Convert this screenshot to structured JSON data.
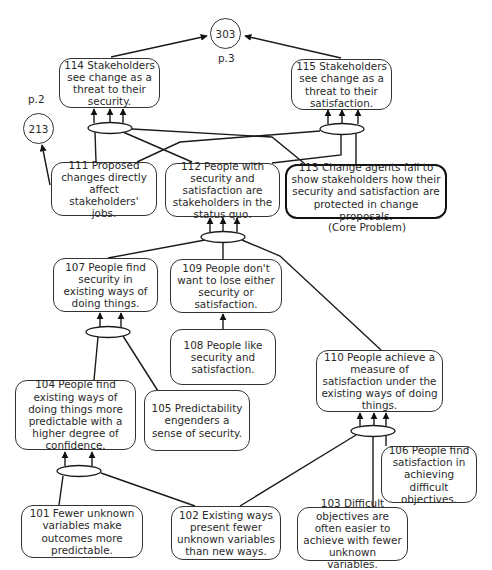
{
  "diagram": {
    "type": "current reality tree",
    "connectors": {
      "303": {
        "label": "303",
        "page": "p.3"
      },
      "213": {
        "label": "213",
        "page": "p.2"
      }
    },
    "nodes": [
      {
        "id": "114",
        "text": "114  Stakeholders see change as a threat to their security."
      },
      {
        "id": "115",
        "text": "115  Stakeholders see change as a threat to their satisfaction."
      },
      {
        "id": "111",
        "text": "111  Proposed changes directly affect stakeholders' jobs."
      },
      {
        "id": "112",
        "text": "112 People with security and satisfaction are stakeholders in the status quo."
      },
      {
        "id": "113",
        "text": "113  Change agents fail to show stakeholders how their security and satisfaction are protected in change proposals.",
        "note": "(Core Problem)"
      },
      {
        "id": "107",
        "text": "107  People find security in existing ways of doing things."
      },
      {
        "id": "109",
        "text": "109  People don't want to lose either security or satisfaction."
      },
      {
        "id": "108",
        "text": "108  People like security and satisfaction."
      },
      {
        "id": "110",
        "text": "110  People achieve a measure of satisfaction under the existing ways of doing things."
      },
      {
        "id": "104",
        "text": "104  People find existing ways of doing things more predictable with a higher degree of confidence."
      },
      {
        "id": "105",
        "text": "105  Predictability engenders a sense of security."
      },
      {
        "id": "106",
        "text": "106  People find satisfaction in achieving difficult objectives."
      },
      {
        "id": "101",
        "text": "101  Fewer unknown variables make outcomes more predictable."
      },
      {
        "id": "102",
        "text": "102  Existing ways present fewer unknown variables than new ways."
      },
      {
        "id": "103",
        "text": "103  Difficult objectives are often easier to achieve with fewer unknown variables."
      }
    ],
    "edges": [
      {
        "from": [
          "111",
          "112",
          "113"
        ],
        "to": "114",
        "type": "and"
      },
      {
        "from": [
          "111",
          "112",
          "113"
        ],
        "to": "115",
        "type": "and"
      },
      {
        "from": [
          "114"
        ],
        "to": "303"
      },
      {
        "from": [
          "115"
        ],
        "to": "303"
      },
      {
        "from": [
          "111"
        ],
        "to": "213"
      },
      {
        "from": [
          "107",
          "109",
          "110"
        ],
        "to": "112",
        "type": "and"
      },
      {
        "from": [
          "108"
        ],
        "to": "109"
      },
      {
        "from": [
          "104",
          "105"
        ],
        "to": "107",
        "type": "and"
      },
      {
        "from": [
          "101",
          "102"
        ],
        "to": "104",
        "type": "and"
      },
      {
        "from": [
          "102",
          "103",
          "106"
        ],
        "to": "110",
        "type": "and"
      }
    ]
  }
}
